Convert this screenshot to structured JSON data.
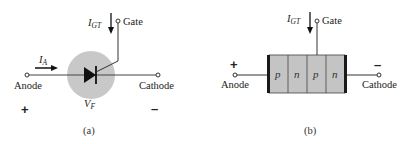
{
  "figure": {
    "panel_a": {
      "caption": "(a)",
      "gate_current": {
        "main": "I",
        "sub": "GT"
      },
      "gate_label": "Gate",
      "anode_current": {
        "main": "I",
        "sub": "A"
      },
      "anode_label": "Anode",
      "cathode_label": "Cathode",
      "voltage": {
        "main": "V",
        "sub": "F"
      },
      "anode_polarity": "+",
      "cathode_polarity": "–",
      "colors": {
        "circle": "#c8c8c8",
        "wire": "#333333",
        "diode": "#111111"
      }
    },
    "panel_b": {
      "caption": "(b)",
      "gate_current": {
        "main": "I",
        "sub": "GT"
      },
      "gate_label": "Gate",
      "anode_label": "Anode",
      "cathode_label": "Cathode",
      "anode_polarity": "+",
      "cathode_polarity": "–",
      "layers": [
        "p",
        "n",
        "p",
        "n"
      ],
      "colors": {
        "block": "#c4c4c4",
        "contact": "#1a1a1a"
      }
    }
  }
}
